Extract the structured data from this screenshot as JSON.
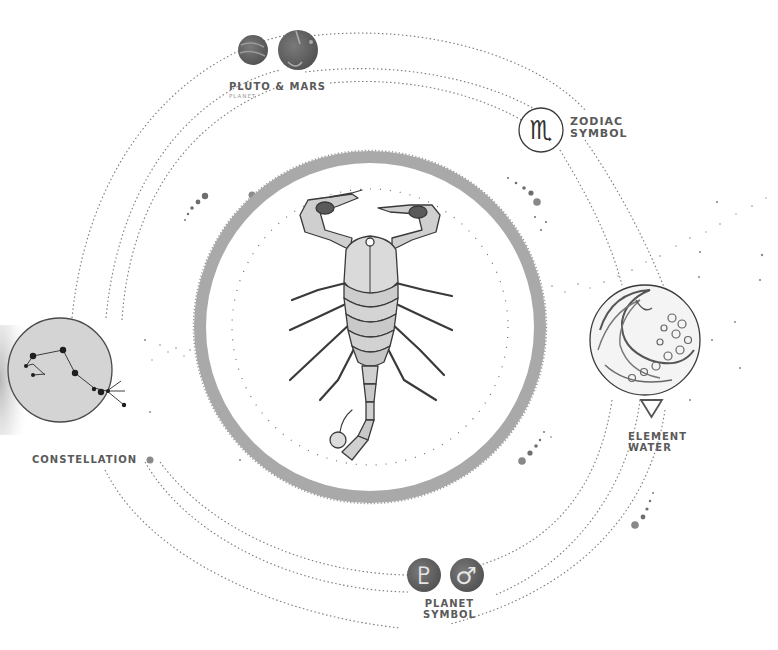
{
  "diagram": {
    "center_illustration": "scorpion",
    "colors": {
      "background": "#ffffff",
      "ring": "#a9a9a9",
      "ink": "#3a3a3a",
      "label": "#5a5a5a",
      "planet_fill": "#6b6b6b",
      "constellation_fill": "#d4d4d4",
      "orbit": "#7a7a7a"
    }
  },
  "labels": {
    "planet": {
      "title": "PLUTO & MARS",
      "subtitle": "PLANET"
    },
    "zodiac": {
      "line1": "ZODIAC",
      "line2": "SYMBOL",
      "glyph": "♏"
    },
    "element": {
      "line1": "ELEMENT",
      "line2": "WATER",
      "icon": "water-triangle-icon"
    },
    "constellation": {
      "title": "CONSTELLATION"
    },
    "planet_symbol": {
      "line1": "PLANET",
      "line2": "SYMBOL",
      "pluto_glyph": "♇",
      "mars_glyph": "♂"
    }
  }
}
